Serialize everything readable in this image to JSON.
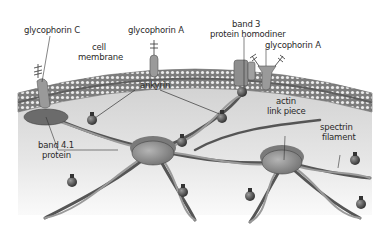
{
  "diagram": {
    "colors": {
      "background": "#ffffff",
      "cytoplasm": "#d9d9d9",
      "membrane_dark": "#8a8a8a",
      "membrane_bead": "#e8e8e8",
      "protein": "#9a9a9a",
      "filament": "#5a5a5a",
      "label_text": "#2a2a2a"
    },
    "labels": {
      "glycophorin_c": "glycophorin C",
      "cell_membrane_1": "cell",
      "cell_membrane_2": "membrane",
      "glycophorin_a_left": "glycophorin A",
      "band3_1": "band 3",
      "band3_2": "protein homodiner",
      "glycophorin_a_right": "glycophorin A",
      "ankyrin": "ankyrin",
      "actin_1": "actin",
      "actin_2": "link piece",
      "spectrin_1": "spectrin",
      "spectrin_2": "filament",
      "band41_1": "band 4.1",
      "band41_2": "protein"
    }
  }
}
